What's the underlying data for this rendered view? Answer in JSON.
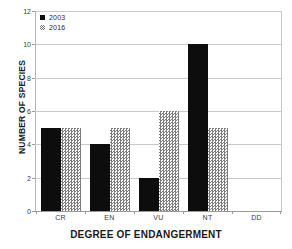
{
  "chart_data": {
    "type": "bar",
    "title": "",
    "xlabel": "DEGREE OF ENDANGERMENT",
    "ylabel": "NUMBER OF SPECIES",
    "categories": [
      "CR",
      "EN",
      "VU",
      "NT",
      "DD"
    ],
    "series": [
      {
        "name": "2003",
        "values": [
          5,
          4,
          2,
          10,
          0
        ],
        "color": "#0d0d0d",
        "pattern": "solid"
      },
      {
        "name": "2016",
        "values": [
          5,
          5,
          6,
          5,
          0
        ],
        "color": "#7d7d7d",
        "pattern": "hatched"
      }
    ],
    "ylim": [
      0,
      12
    ],
    "yticks": [
      0,
      2,
      4,
      6,
      8,
      10,
      12
    ],
    "ytick_labels": [
      "0",
      "2",
      "4",
      "6",
      "8",
      "10",
      "12"
    ],
    "grid": "horizontal",
    "legend_position": "top-left"
  },
  "legend": {
    "entries": [
      {
        "label": "2003"
      },
      {
        "label": "2016"
      }
    ]
  },
  "axes": {
    "y_title": "NUMBER OF SPECIES",
    "x_title": "DEGREE OF ENDANGERMENT"
  }
}
